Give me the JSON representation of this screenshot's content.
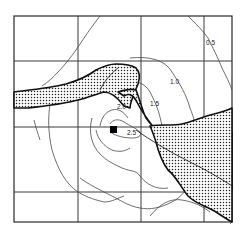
{
  "map": {
    "type": "isopleth-contour-map",
    "contour_labels": [
      {
        "id": "c05",
        "text": "0.5"
      },
      {
        "id": "c10",
        "text": "1.0"
      },
      {
        "id": "c15",
        "text": "1.5"
      },
      {
        "id": "c20",
        "text": "2.0"
      },
      {
        "id": "c25",
        "text": "2.5"
      }
    ],
    "contour_levels": [
      0.5,
      1.0,
      1.5,
      2.0,
      2.5
    ],
    "legend": {
      "stippled_band": "water body / river channel",
      "source_marker": "source location"
    },
    "grid": {
      "columns": 4,
      "rows": 4
    },
    "colors": {
      "line": "#4a4a4a",
      "frame": "#2a2a2a",
      "band_outline": "#111111",
      "stipple_dot": "#222222",
      "background": "#ffffff"
    }
  }
}
